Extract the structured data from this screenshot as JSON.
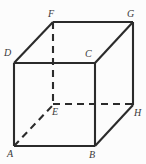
{
  "figure": {
    "name": "cube-diagram",
    "type": "geometric-solid",
    "shape": "cube",
    "width": 146,
    "height": 164,
    "background_color": "#fcfcfc",
    "stroke_color": "#2b2b2b",
    "label_color": "#3a3a3a",
    "solid_stroke_width": 2.1,
    "dashed_stroke_width": 2.1,
    "dash_pattern": "7,5"
  },
  "vertices": [
    {
      "id": "A",
      "label": "A",
      "x": 14,
      "y": 146,
      "label_x": 7,
      "label_y": 149,
      "hidden": false
    },
    {
      "id": "B",
      "label": "B",
      "x": 95,
      "y": 146,
      "label_x": 89,
      "label_y": 150,
      "hidden": false
    },
    {
      "id": "C",
      "label": "C",
      "x": 95,
      "y": 63,
      "label_x": 85,
      "label_y": 49,
      "hidden": false
    },
    {
      "id": "D",
      "label": "D",
      "x": 14,
      "y": 63,
      "label_x": 4,
      "label_y": 48,
      "hidden": false
    },
    {
      "id": "E",
      "label": "E",
      "x": 53,
      "y": 105,
      "label_x": 52,
      "label_y": 107,
      "hidden": true
    },
    {
      "id": "F",
      "label": "F",
      "x": 53,
      "y": 22,
      "label_x": 48,
      "label_y": 9,
      "hidden": false
    },
    {
      "id": "G",
      "label": "G",
      "x": 133,
      "y": 22,
      "label_x": 127,
      "label_y": 9,
      "hidden": false
    },
    {
      "id": "H",
      "label": "H",
      "x": 133,
      "y": 105,
      "label_x": 134,
      "label_y": 108,
      "hidden": false
    }
  ],
  "edges": [
    {
      "id": "AB",
      "from": "A",
      "to": "B",
      "style": "solid",
      "x1": 14,
      "y1": 146,
      "x2": 95,
      "y2": 146
    },
    {
      "id": "BC",
      "from": "B",
      "to": "C",
      "style": "solid",
      "x1": 95,
      "y1": 146,
      "x2": 95,
      "y2": 63
    },
    {
      "id": "CD",
      "from": "C",
      "to": "D",
      "style": "solid",
      "x1": 95,
      "y1": 63,
      "x2": 14,
      "y2": 63
    },
    {
      "id": "DA",
      "from": "D",
      "to": "A",
      "style": "solid",
      "x1": 14,
      "y1": 63,
      "x2": 14,
      "y2": 146
    },
    {
      "id": "FG",
      "from": "F",
      "to": "G",
      "style": "solid",
      "x1": 53,
      "y1": 22,
      "x2": 133,
      "y2": 22
    },
    {
      "id": "GH",
      "from": "G",
      "to": "H",
      "style": "solid",
      "x1": 133,
      "y1": 22,
      "x2": 133,
      "y2": 105
    },
    {
      "id": "DF",
      "from": "D",
      "to": "F",
      "style": "solid",
      "x1": 14,
      "y1": 63,
      "x2": 53,
      "y2": 22
    },
    {
      "id": "CG",
      "from": "C",
      "to": "G",
      "style": "solid",
      "x1": 95,
      "y1": 63,
      "x2": 133,
      "y2": 22
    },
    {
      "id": "BH",
      "from": "B",
      "to": "H",
      "style": "solid",
      "x1": 95,
      "y1": 146,
      "x2": 133,
      "y2": 105
    },
    {
      "id": "FE",
      "from": "F",
      "to": "E",
      "style": "dashed",
      "x1": 53,
      "y1": 22,
      "x2": 53,
      "y2": 105
    },
    {
      "id": "EH",
      "from": "E",
      "to": "H",
      "style": "dashed",
      "x1": 53,
      "y1": 104,
      "x2": 133,
      "y2": 104
    },
    {
      "id": "AE",
      "from": "A",
      "to": "E",
      "style": "dashed",
      "x1": 14,
      "y1": 146,
      "x2": 53,
      "y2": 105
    }
  ]
}
